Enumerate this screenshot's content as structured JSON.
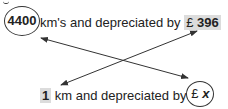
{
  "top_line": {
    "value_circled": "4400",
    "text_mid": "km's and depreciated by",
    "currency": "£",
    "value_highlighted": "396"
  },
  "bottom_line": {
    "value_highlighted": "1",
    "text_mid": "km and depreciated by",
    "currency": "£",
    "variable": "x"
  },
  "arrows": [
    {
      "from": "4400",
      "to": "£ x",
      "type": "double-headed"
    },
    {
      "from": "1",
      "to": "£ 396",
      "type": "double-headed"
    }
  ],
  "colors": {
    "text": "#222222",
    "highlight": "#dcdcdc",
    "stroke": "#333333"
  }
}
